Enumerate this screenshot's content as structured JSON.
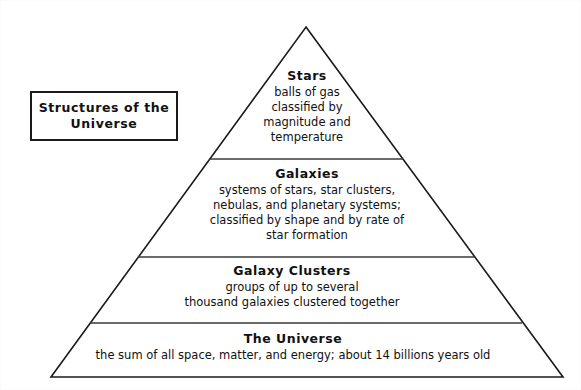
{
  "document": {
    "kind": "pyramid-diagram",
    "title_box": {
      "label": "Structures of the\nUniverse"
    },
    "colors": {
      "ink": "#111111",
      "stroke": "#1a1a1a",
      "background": "#ffffff"
    }
  },
  "pyramid": {
    "geometry": {
      "apex": [
        305,
        26
      ],
      "bottom_left": [
        50,
        376
      ],
      "bottom_right": [
        562,
        376
      ],
      "divider_y": [
        158,
        256,
        322
      ]
    },
    "levels": [
      {
        "id": "stars",
        "rank": 1,
        "heading": "Stars",
        "body": "balls of gas\nclassified by\nmagnitude and\ntemperature"
      },
      {
        "id": "galaxies",
        "rank": 2,
        "heading": "Galaxies",
        "body": "systems of stars, star clusters,\nnebulas, and planetary systems;\nclassified by shape and by rate of\nstar formation"
      },
      {
        "id": "galaxy-clusters",
        "rank": 3,
        "heading": "Galaxy Clusters",
        "body": "groups of up to several\nthousand galaxies clustered together"
      },
      {
        "id": "the-universe",
        "rank": 4,
        "heading": "The Universe",
        "body": "the sum of all space, matter, and energy; about 14 billions years old"
      }
    ]
  }
}
